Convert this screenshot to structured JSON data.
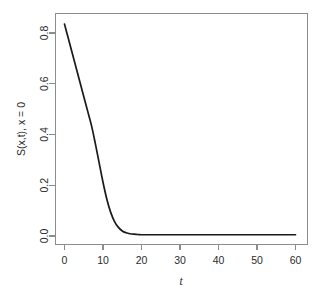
{
  "figure": {
    "background_color": "#ffffff",
    "curve_color": "#1a1a1a",
    "axis_color": "#8c8c8c",
    "text_color": "#2b2b2b"
  },
  "chart_data": {
    "type": "line",
    "title": "",
    "subtitle": "",
    "xlabel": "t",
    "ylabel": "S(x,t), x = 0",
    "xlim": [
      -1.5,
      61.5
    ],
    "ylim": [
      -0.035,
      0.875
    ],
    "grid": false,
    "legend": null,
    "xticks": [
      0,
      10,
      20,
      30,
      40,
      50,
      60
    ],
    "xticklabels": [
      "0",
      "10",
      "20",
      "30",
      "40",
      "50",
      "60"
    ],
    "yticks": [
      0.0,
      0.2,
      0.4,
      0.6,
      0.8
    ],
    "yticklabels": [
      "0.0",
      "0.2",
      "0.4",
      "0.6",
      "0.8"
    ],
    "series": [
      {
        "name": "S(x,t) at x = 0",
        "x": [
          0,
          1,
          2,
          3,
          4,
          5,
          6,
          7,
          8,
          9,
          10,
          11,
          12,
          13,
          14,
          15,
          16,
          17,
          18,
          19,
          20,
          22,
          24,
          26,
          28,
          30,
          35,
          40,
          45,
          50,
          55,
          60
        ],
        "y": [
          0.835,
          0.778,
          0.721,
          0.664,
          0.607,
          0.55,
          0.493,
          0.436,
          0.365,
          0.288,
          0.212,
          0.145,
          0.093,
          0.057,
          0.034,
          0.02,
          0.013,
          0.009,
          0.007,
          0.006,
          0.005,
          0.005,
          0.005,
          0.005,
          0.005,
          0.005,
          0.005,
          0.005,
          0.005,
          0.005,
          0.005,
          0.005
        ]
      }
    ]
  },
  "axis_labels": {
    "x_title": "t",
    "y_title": "S(x,t), x = 0"
  }
}
